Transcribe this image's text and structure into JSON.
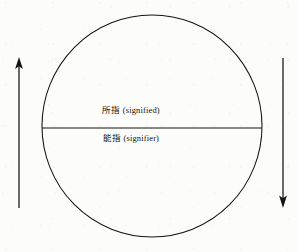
{
  "figure": {
    "background_color": "#fcfcfa",
    "ink_color": "#15130f"
  },
  "circle": {
    "name": "sign-circle",
    "center_x": 152,
    "center_y": 126,
    "radius_x": 110,
    "radius_y": 111
  },
  "divider": {
    "name": "diameter-line",
    "y": 128,
    "x_start": 42,
    "x_end": 262
  },
  "labels": {
    "signified": "所指 (signified)",
    "signifier": "能指 (signifier)"
  },
  "arrows": {
    "left": {
      "name": "left-arrow-up",
      "direction": "up",
      "x": 19,
      "y_tail": 208,
      "y_tip": 58
    },
    "right": {
      "name": "right-arrow-down",
      "direction": "down",
      "x": 283,
      "y_tail": 58,
      "y_tip": 207
    }
  }
}
